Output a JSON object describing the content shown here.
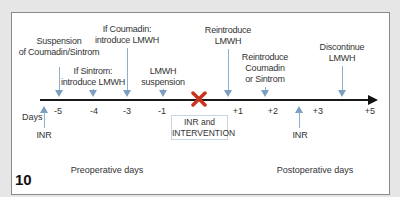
{
  "figure": {
    "number": "10",
    "axis_label": "Days",
    "colors": {
      "background": "#e6e6e6",
      "panel": "#ffffff",
      "axis": "#1a1a1a",
      "arrow": "#7d9fbf",
      "intervention_mark": "#c8341e"
    }
  },
  "timeline": {
    "ticks": [
      "-5",
      "-4",
      "-3",
      "-1",
      "+1",
      "+2",
      "+3",
      "+5"
    ],
    "intervention_mark": "X",
    "intervention_box": {
      "line1": "INR and",
      "line2": "INTERVENTION"
    }
  },
  "events_above": [
    {
      "line1": "Suspension",
      "line2": "of Coumadin/Sintrom",
      "day": "-5"
    },
    {
      "line1": "If Sintrom:",
      "line2": "introduce LMWH",
      "day": "-4"
    },
    {
      "line1": "If Coumadin:",
      "line2": "introduce LMWH",
      "day": "-3"
    },
    {
      "line1": "LMWH",
      "line2": "suspension",
      "day": "-1"
    },
    {
      "line1": "Reintroduce",
      "line2": "LMWH",
      "day": "+1"
    },
    {
      "line1": "Reintroduce",
      "line2": "Coumadin",
      "line3": "or Sintrom",
      "day": "+2"
    },
    {
      "line1": "Discontinue",
      "line2": "LMWH",
      "day": "+4"
    }
  ],
  "events_below": [
    {
      "label": "INR",
      "day": "-6"
    },
    {
      "label": "INR",
      "day": "+3"
    }
  ],
  "sections": {
    "preoperative": "Preoperative days",
    "postoperative": "Postoperative days"
  }
}
